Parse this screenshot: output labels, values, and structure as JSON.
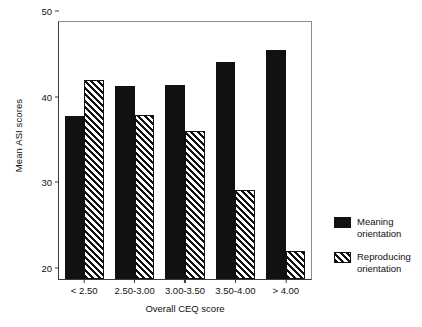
{
  "chart_data": {
    "type": "bar",
    "title": "",
    "xlabel": "Overall CEQ score",
    "ylabel": "Mean ASI scores",
    "categories": [
      "< 2.50",
      "2.50-3.00",
      "3.00-3.50",
      "3.50-4.00",
      "> 4.00"
    ],
    "series": [
      {
        "name": "Meaning orientation",
        "values": [
          39.0,
          42.5,
          42.6,
          45.3,
          46.7
        ],
        "pattern": "solid",
        "color": "#111111"
      },
      {
        "name": "Reproducing orientation",
        "values": [
          43.2,
          39.2,
          37.3,
          30.4,
          23.3
        ],
        "pattern": "diagonal-hatch",
        "color": "#111111"
      }
    ],
    "ylim": [
      20,
      50
    ],
    "yticks": [
      20,
      30,
      40,
      50
    ],
    "ytick_labels": [
      "20",
      "30",
      "40",
      "50"
    ],
    "grid": false,
    "legend_position": "right"
  }
}
